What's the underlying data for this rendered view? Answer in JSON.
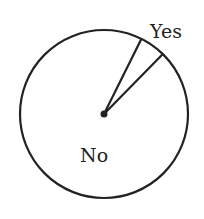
{
  "chart_data": {
    "type": "pie",
    "title": "",
    "slices": [
      {
        "label": "Yes",
        "value": 5
      },
      {
        "label": "No",
        "value": 95
      }
    ],
    "start_angle_deg_from_top": 26.5,
    "colors": {
      "stroke": "#222222",
      "fill": "#ffffff",
      "text": "#222222"
    }
  }
}
